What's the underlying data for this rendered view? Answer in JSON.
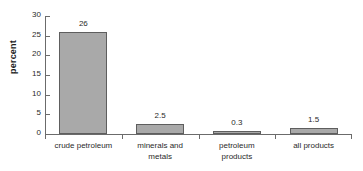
{
  "chart_data": {
    "type": "bar",
    "title": "",
    "xlabel": "",
    "ylabel": "percent",
    "categories": [
      "crude petroleum",
      "minerals and metals",
      "petroleum products",
      "all products"
    ],
    "values": [
      26,
      2.5,
      0.3,
      1.5
    ],
    "value_labels": [
      "26",
      "2.5",
      "0.3",
      "1.5"
    ],
    "ylim": [
      0,
      30
    ],
    "yticks": [
      0,
      5,
      10,
      15,
      20,
      25,
      30
    ],
    "ytick_labels": [
      "0",
      "5",
      "10",
      "15",
      "20",
      "25",
      "30"
    ],
    "grid": false,
    "legend": false,
    "bar_color": "#a9a9a9",
    "bar_border_color": "#5e5e5e",
    "axis_color": "#6b6b6b",
    "text_color": "#2a2a2a"
  }
}
